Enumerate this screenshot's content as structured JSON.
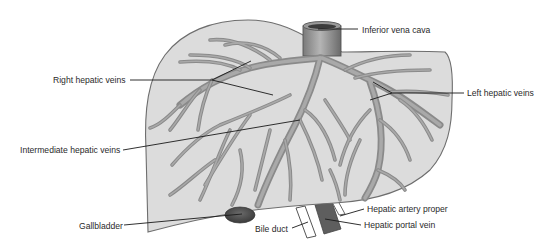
{
  "diagram": {
    "colors": {
      "background": "#ffffff",
      "liver_fill": "#dcdcdc",
      "liver_outline": "#6e6e6e",
      "vein": "#8f8f8f",
      "vessel_dark": "#555555",
      "leader_line": "#1a1a1a",
      "label_text": "#2a2a2a"
    },
    "labels": [
      {
        "id": "inferior-vena-cava",
        "text": "Inferior vena cava",
        "x": 362,
        "y": 33,
        "anchor": "start",
        "target": [
          318,
          29
        ],
        "elbow": null
      },
      {
        "id": "right-hepatic-veins",
        "text": "Right hepatic veins",
        "x": 53,
        "y": 82,
        "anchor": "start",
        "target": [
          251,
          61
        ],
        "elbow": [
          212,
          80
        ],
        "target2": [
          273,
          95
        ]
      },
      {
        "id": "left-hepatic-veins",
        "text": "Left hepatic veins",
        "x": 467,
        "y": 96,
        "anchor": "start",
        "target": [
          373,
          82
        ],
        "elbow": [
          392,
          93
        ],
        "target2": [
          370,
          100
        ]
      },
      {
        "id": "intermediate-hepatic-veins",
        "text": "Intermediate hepatic veins",
        "x": 20,
        "y": 152,
        "anchor": "start",
        "target": [
          300,
          120
        ],
        "elbow": null
      },
      {
        "id": "gallbladder",
        "text": "Gallbladder",
        "x": 79,
        "y": 228,
        "anchor": "start",
        "target": [
          242,
          214
        ],
        "elbow": null
      },
      {
        "id": "bile-duct",
        "text": "Bile duct",
        "x": 255,
        "y": 231,
        "anchor": "start",
        "target": [
          308,
          222
        ],
        "elbow": null
      },
      {
        "id": "hepatic-artery-proper",
        "text": "Hepatic artery proper",
        "x": 367,
        "y": 212,
        "anchor": "start",
        "target": [
          340,
          217
        ],
        "elbow": null
      },
      {
        "id": "hepatic-portal-vein",
        "text": "Hepatic portal vein",
        "x": 364,
        "y": 228,
        "anchor": "start",
        "target": [
          325,
          219
        ],
        "elbow": null
      }
    ]
  }
}
